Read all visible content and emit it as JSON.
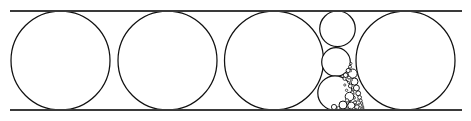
{
  "figure": {
    "background_color": "#ffffff",
    "stroke_color": "#111111",
    "rail_color": "#3a3a3a",
    "rail_stroke_width": 2.1,
    "canvas": {
      "width": 471,
      "height": 121
    }
  },
  "rails": [
    {
      "name": "top-rail",
      "x1": 10,
      "y1": 11.0,
      "x2": 462,
      "y2": 11.0
    },
    {
      "name": "bottom-rail",
      "x1": 10,
      "y1": 110.0,
      "x2": 462,
      "y2": 110.0
    }
  ],
  "circles": [
    {
      "name": "large-circle-1",
      "cx": 60.5,
      "cy": 60.5,
      "r": 49.5,
      "sw": 1.25
    },
    {
      "name": "large-circle-2",
      "cx": 167.5,
      "cy": 60.5,
      "r": 49.5,
      "sw": 1.25
    },
    {
      "name": "large-circle-3",
      "cx": 274.0,
      "cy": 60.5,
      "r": 49.5,
      "sw": 1.25
    },
    {
      "name": "large-circle-4",
      "cx": 405.5,
      "cy": 60.5,
      "r": 49.5,
      "sw": 1.25
    },
    {
      "name": "column-circle-top",
      "cx": 337.5,
      "cy": 28.8,
      "r": 17.8,
      "sw": 1.2
    },
    {
      "name": "column-circle-middle",
      "cx": 336.0,
      "cy": 62.0,
      "r": 14.3,
      "sw": 1.2
    },
    {
      "name": "column-circle-bottom",
      "cx": 335.0,
      "cy": 93.0,
      "r": 17.2,
      "sw": 1.2
    },
    {
      "name": "gap-circle-a1",
      "cx": 352.6,
      "cy": 73.6,
      "r": 4.6,
      "sw": 1.0
    },
    {
      "name": "gap-circle-a2",
      "cx": 354.4,
      "cy": 81.6,
      "r": 3.6,
      "sw": 1.0
    },
    {
      "name": "gap-circle-a3",
      "cx": 356.4,
      "cy": 88.0,
      "r": 3.0,
      "sw": 0.95
    },
    {
      "name": "gap-circle-a4",
      "cx": 358.2,
      "cy": 93.3,
      "r": 2.4,
      "sw": 0.9
    },
    {
      "name": "gap-circle-a5",
      "cx": 359.6,
      "cy": 97.4,
      "r": 1.9,
      "sw": 0.85
    },
    {
      "name": "gap-circle-a6",
      "cx": 360.7,
      "cy": 100.6,
      "r": 1.5,
      "sw": 0.8
    },
    {
      "name": "gap-circle-a7",
      "cx": 361.6,
      "cy": 103.1,
      "r": 1.2,
      "sw": 0.75
    },
    {
      "name": "gap-circle-a8",
      "cx": 362.3,
      "cy": 105.1,
      "r": 0.95,
      "sw": 0.7
    },
    {
      "name": "gap-circle-a9",
      "cx": 362.9,
      "cy": 106.6,
      "r": 0.75,
      "sw": 0.65
    },
    {
      "name": "gap-circle-a10",
      "cx": 363.3,
      "cy": 107.7,
      "r": 0.58,
      "sw": 0.6
    },
    {
      "name": "gap-circle-a11",
      "cx": 363.7,
      "cy": 108.5,
      "r": 0.45,
      "sw": 0.55
    },
    {
      "name": "gap-circle-b1",
      "cx": 345.6,
      "cy": 75.2,
      "r": 2.3,
      "sw": 0.9
    },
    {
      "name": "gap-circle-b2",
      "cx": 348.2,
      "cy": 70.5,
      "r": 2.1,
      "sw": 0.9
    },
    {
      "name": "gap-circle-b3",
      "cx": 350.0,
      "cy": 66.8,
      "r": 1.5,
      "sw": 0.8
    },
    {
      "name": "gap-circle-b4",
      "cx": 350.9,
      "cy": 63.5,
      "r": 1.1,
      "sw": 0.75
    },
    {
      "name": "gap-circle-b5",
      "cx": 344.6,
      "cy": 78.8,
      "r": 1.6,
      "sw": 0.8
    },
    {
      "name": "gap-circle-b6",
      "cx": 349.0,
      "cy": 77.6,
      "r": 1.5,
      "sw": 0.8
    },
    {
      "name": "gap-circle-b7",
      "cx": 350.3,
      "cy": 86.0,
      "r": 1.9,
      "sw": 0.85
    },
    {
      "name": "gap-circle-b8",
      "cx": 352.2,
      "cy": 92.5,
      "r": 1.7,
      "sw": 0.8
    },
    {
      "name": "gap-circle-b9",
      "cx": 354.0,
      "cy": 97.8,
      "r": 1.4,
      "sw": 0.75
    },
    {
      "name": "gap-circle-b10",
      "cx": 355.4,
      "cy": 101.8,
      "r": 1.1,
      "sw": 0.7
    },
    {
      "name": "gap-circle-b11",
      "cx": 356.5,
      "cy": 104.7,
      "r": 0.9,
      "sw": 0.65
    },
    {
      "name": "gap-circle-c1",
      "cx": 349.5,
      "cy": 96.6,
      "r": 4.3,
      "sw": 1.0
    },
    {
      "name": "gap-circle-c2",
      "cx": 343.0,
      "cy": 105.0,
      "r": 4.0,
      "sw": 1.0
    },
    {
      "name": "gap-circle-c3",
      "cx": 351.3,
      "cy": 105.6,
      "r": 3.6,
      "sw": 0.95
    },
    {
      "name": "gap-circle-c4",
      "cx": 357.0,
      "cy": 107.2,
      "r": 2.4,
      "sw": 0.9
    },
    {
      "name": "gap-circle-c5",
      "cx": 334.0,
      "cy": 107.0,
      "r": 2.6,
      "sw": 0.9
    },
    {
      "name": "gap-circle-c6",
      "cx": 347.0,
      "cy": 100.4,
      "r": 1.7,
      "sw": 0.8
    },
    {
      "name": "gap-circle-c7",
      "cx": 355.0,
      "cy": 102.4,
      "r": 1.5,
      "sw": 0.75
    },
    {
      "name": "gap-circle-c8",
      "cx": 360.0,
      "cy": 108.2,
      "r": 1.5,
      "sw": 0.75
    },
    {
      "name": "gap-circle-c9",
      "cx": 338.4,
      "cy": 108.1,
      "r": 1.6,
      "sw": 0.75
    },
    {
      "name": "gap-circle-c10",
      "cx": 347.0,
      "cy": 108.8,
      "r": 1.1,
      "sw": 0.7
    },
    {
      "name": "gap-circle-c11",
      "cx": 353.8,
      "cy": 108.6,
      "r": 1.1,
      "sw": 0.7
    },
    {
      "name": "gap-circle-d1",
      "cx": 344.8,
      "cy": 85.0,
      "r": 1.1,
      "sw": 0.7
    },
    {
      "name": "gap-circle-d2",
      "cx": 346.6,
      "cy": 90.3,
      "r": 1.2,
      "sw": 0.7
    },
    {
      "name": "gap-circle-d3",
      "cx": 351.5,
      "cy": 80.0,
      "r": 1.0,
      "sw": 0.65
    },
    {
      "name": "gap-circle-d4",
      "cx": 352.9,
      "cy": 89.8,
      "r": 1.0,
      "sw": 0.65
    },
    {
      "name": "gap-circle-d5",
      "cx": 358.0,
      "cy": 100.5,
      "r": 0.9,
      "sw": 0.6
    },
    {
      "name": "gap-circle-d6",
      "cx": 359.1,
      "cy": 104.0,
      "r": 0.8,
      "sw": 0.6
    },
    {
      "name": "gap-circle-d7",
      "cx": 361.2,
      "cy": 108.6,
      "r": 0.8,
      "sw": 0.6
    },
    {
      "name": "gap-circle-d8",
      "cx": 350.6,
      "cy": 109.0,
      "r": 0.7,
      "sw": 0.55
    },
    {
      "name": "gap-circle-d9",
      "cx": 356.6,
      "cy": 109.1,
      "r": 0.7,
      "sw": 0.55
    },
    {
      "name": "gap-circle-d10",
      "cx": 341.0,
      "cy": 109.2,
      "r": 0.7,
      "sw": 0.55
    },
    {
      "name": "gap-circle-d11",
      "cx": 344.0,
      "cy": 109.3,
      "r": 0.6,
      "sw": 0.5
    },
    {
      "name": "gap-circle-d12",
      "cx": 362.8,
      "cy": 109.3,
      "r": 0.5,
      "sw": 0.5
    },
    {
      "name": "gap-circle-d13",
      "cx": 353.6,
      "cy": 94.0,
      "r": 0.8,
      "sw": 0.6
    },
    {
      "name": "gap-circle-d14",
      "cx": 348.6,
      "cy": 82.4,
      "r": 1.0,
      "sw": 0.65
    },
    {
      "name": "gap-circle-d15",
      "cx": 350.8,
      "cy": 71.0,
      "r": 0.9,
      "sw": 0.6
    }
  ]
}
